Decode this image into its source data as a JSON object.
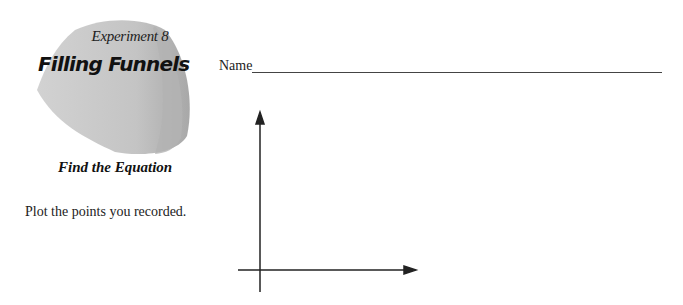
{
  "header": {
    "experiment_label": "Experiment 8",
    "title": "Filling Funnels",
    "subtitle": "Find the Equation"
  },
  "name_field": {
    "label": "Name",
    "value": ""
  },
  "instructions": "Plot the points you recorded.",
  "graph": {
    "x_axis_label": "",
    "y_axis_label": "",
    "axis_color": "#222222"
  },
  "colors": {
    "funnel_fill": "#c8c8c8",
    "funnel_shadow": "#a9a9a9"
  }
}
